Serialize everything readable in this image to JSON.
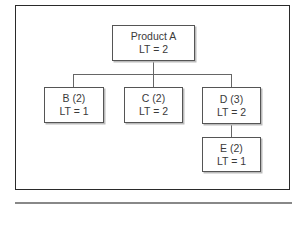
{
  "diagram": {
    "type": "product-structure-tree",
    "root": {
      "name": "Product A",
      "lt": "LT = 2"
    },
    "children": [
      {
        "name": "B (2)",
        "lt": "LT = 1"
      },
      {
        "name": "C (2)",
        "lt": "LT = 2"
      },
      {
        "name": "D (3)",
        "lt": "LT = 2",
        "children": [
          {
            "name": "E (2)",
            "lt": "LT = 1"
          }
        ]
      }
    ]
  }
}
